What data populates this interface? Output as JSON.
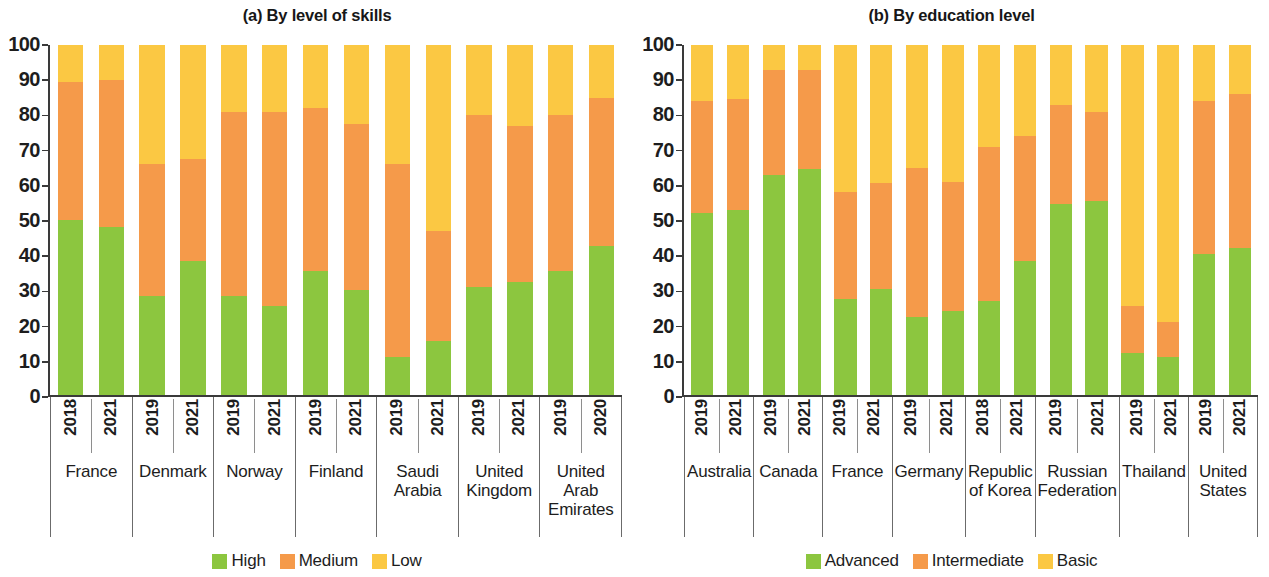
{
  "chart_data": [
    {
      "type": "bar",
      "subtype": "stacked-100-percent",
      "title": "(a) By level of skills",
      "xlabel": "",
      "ylabel": "",
      "ylim": [
        0,
        100
      ],
      "yticks": [
        0,
        10,
        20,
        30,
        40,
        50,
        60,
        70,
        80,
        90,
        100
      ],
      "grid": false,
      "legend_position": "bottom",
      "legend": [
        "High",
        "Medium",
        "Low"
      ],
      "colors": {
        "High": "#8CC63F",
        "Medium": "#F59A4A",
        "Low": "#FBC843"
      },
      "groups": [
        {
          "name": "France",
          "years": [
            "2018",
            "2021"
          ]
        },
        {
          "name": "Denmark",
          "years": [
            "2019",
            "2021"
          ]
        },
        {
          "name": "Norway",
          "years": [
            "2019",
            "2021"
          ]
        },
        {
          "name": "Finland",
          "years": [
            "2019",
            "2021"
          ]
        },
        {
          "name": "Saudi Arabia",
          "years": [
            "2019",
            "2021"
          ]
        },
        {
          "name": "United Kingdom",
          "years": [
            "2019",
            "2021"
          ]
        },
        {
          "name": "United Arab Emirates",
          "years": [
            "2019",
            "2020"
          ]
        }
      ],
      "categories": [
        "France 2018",
        "France 2021",
        "Denmark 2019",
        "Denmark 2021",
        "Norway 2019",
        "Norway 2021",
        "Finland 2019",
        "Finland 2021",
        "Saudi Arabia 2019",
        "Saudi Arabia 2021",
        "United Kingdom 2019",
        "United Kingdom 2021",
        "United Arab Emirates 2019",
        "United Arab Emirates 2020"
      ],
      "series": [
        {
          "name": "High",
          "values": [
            50.0,
            48.0,
            28.5,
            38.5,
            28.5,
            25.5,
            35.5,
            30.0,
            11.0,
            15.5,
            31.0,
            32.5,
            35.5,
            42.5
          ]
        },
        {
          "name": "Medium",
          "values": [
            39.5,
            42.0,
            37.5,
            29.0,
            52.5,
            55.5,
            46.5,
            47.5,
            55.0,
            31.5,
            49.0,
            44.5,
            44.5,
            42.5
          ]
        },
        {
          "name": "Low",
          "values": [
            10.5,
            10.0,
            34.0,
            32.5,
            19.0,
            19.0,
            18.0,
            22.5,
            34.0,
            53.0,
            20.0,
            23.0,
            20.0,
            15.0
          ]
        }
      ],
      "cumulative_tops": [
        {
          "high": 50.0,
          "medium": 89.5
        },
        {
          "high": 48.0,
          "medium": 90.0
        },
        {
          "high": 28.5,
          "medium": 66.0
        },
        {
          "high": 38.5,
          "medium": 67.5
        },
        {
          "high": 28.5,
          "medium": 81.0
        },
        {
          "high": 25.5,
          "medium": 81.0
        },
        {
          "high": 35.5,
          "medium": 82.0
        },
        {
          "high": 30.0,
          "medium": 77.5
        },
        {
          "high": 11.0,
          "medium": 66.0
        },
        {
          "high": 15.5,
          "medium": 47.0
        },
        {
          "high": 31.0,
          "medium": 80.0
        },
        {
          "high": 32.5,
          "medium": 77.0
        },
        {
          "high": 35.5,
          "medium": 80.0
        },
        {
          "high": 42.5,
          "medium": 85.0
        }
      ]
    },
    {
      "type": "bar",
      "subtype": "stacked-100-percent",
      "title": "(b) By education level",
      "xlabel": "",
      "ylabel": "",
      "ylim": [
        0,
        100
      ],
      "yticks": [
        0,
        10,
        20,
        30,
        40,
        50,
        60,
        70,
        80,
        90,
        100
      ],
      "grid": false,
      "legend_position": "bottom",
      "legend": [
        "Advanced",
        "Intermediate",
        "Basic"
      ],
      "colors": {
        "Advanced": "#8CC63F",
        "Intermediate": "#F59A4A",
        "Basic": "#FBC843"
      },
      "groups": [
        {
          "name": "Australia",
          "years": [
            "2019",
            "2021"
          ]
        },
        {
          "name": "Canada",
          "years": [
            "2019",
            "2021"
          ]
        },
        {
          "name": "France",
          "years": [
            "2019",
            "2021"
          ]
        },
        {
          "name": "Germany",
          "years": [
            "2019",
            "2021"
          ]
        },
        {
          "name": "Republic of Korea",
          "years": [
            "2018",
            "2021"
          ]
        },
        {
          "name": "Russian Federation",
          "years": [
            "2019",
            "2021"
          ]
        },
        {
          "name": "Thailand",
          "years": [
            "2019",
            "2021"
          ]
        },
        {
          "name": "United States",
          "years": [
            "2019",
            "2021"
          ]
        }
      ],
      "categories": [
        "Australia 2019",
        "Australia 2021",
        "Canada 2019",
        "Canada 2021",
        "France 2019",
        "France 2021",
        "Germany 2019",
        "Germany 2021",
        "Republic of Korea 2018",
        "Republic of Korea 2021",
        "Russian Federation 2019",
        "Russian Federation 2021",
        "Thailand 2019",
        "Thailand 2021",
        "United States 2019",
        "United States 2021"
      ],
      "series": [
        {
          "name": "Advanced",
          "values": [
            52.0,
            53.0,
            63.0,
            64.5,
            27.5,
            30.5,
            22.5,
            24.0,
            27.0,
            38.5,
            54.5,
            55.5,
            12.0,
            11.0,
            40.5,
            42.0
          ]
        },
        {
          "name": "Intermediate",
          "values": [
            32.0,
            31.5,
            30.0,
            28.5,
            30.5,
            30.0,
            42.5,
            37.0,
            44.0,
            35.5,
            28.5,
            25.5,
            13.5,
            10.0,
            43.5,
            44.0
          ]
        },
        {
          "name": "Basic",
          "values": [
            16.0,
            15.5,
            7.0,
            7.0,
            42.0,
            39.5,
            35.0,
            39.0,
            29.0,
            26.0,
            17.0,
            19.0,
            74.5,
            79.0,
            16.0,
            14.0
          ]
        }
      ],
      "cumulative_tops": [
        {
          "advanced": 52.0,
          "intermediate": 84.0
        },
        {
          "advanced": 53.0,
          "intermediate": 84.5
        },
        {
          "advanced": 63.0,
          "intermediate": 93.0
        },
        {
          "advanced": 64.5,
          "intermediate": 93.0
        },
        {
          "advanced": 27.5,
          "intermediate": 58.0
        },
        {
          "advanced": 30.5,
          "intermediate": 60.5
        },
        {
          "advanced": 22.5,
          "intermediate": 65.0
        },
        {
          "advanced": 24.0,
          "intermediate": 61.0
        },
        {
          "advanced": 27.0,
          "intermediate": 71.0
        },
        {
          "advanced": 38.5,
          "intermediate": 74.0
        },
        {
          "advanced": 54.5,
          "intermediate": 83.0
        },
        {
          "advanced": 55.5,
          "intermediate": 81.0
        },
        {
          "advanced": 12.0,
          "intermediate": 25.5
        },
        {
          "advanced": 11.0,
          "intermediate": 21.0
        },
        {
          "advanced": 40.5,
          "intermediate": 84.0
        },
        {
          "advanced": 42.0,
          "intermediate": 86.0
        }
      ]
    }
  ]
}
